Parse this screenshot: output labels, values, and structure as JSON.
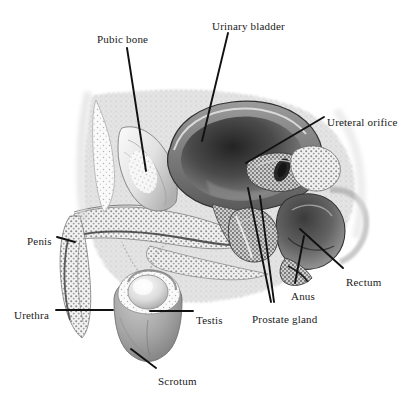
{
  "figure": {
    "background_color": "#ffffff",
    "ink_color": "#1a1a1a",
    "style": "grayscale engraving / stipple halftone",
    "width": 405,
    "height": 400
  },
  "labels": [
    {
      "id": "pubic-bone",
      "text": "Pubic bone",
      "x": 97,
      "y": 33,
      "anchor": "start"
    },
    {
      "id": "urinary-bladder",
      "text": "Urinary bladder",
      "x": 212,
      "y": 20,
      "anchor": "start"
    },
    {
      "id": "ureteral-orifice",
      "text": "Ureteral orifice",
      "x": 327,
      "y": 116,
      "anchor": "start"
    },
    {
      "id": "rectum",
      "text": "Rectum",
      "x": 346,
      "y": 276,
      "anchor": "start"
    },
    {
      "id": "anus",
      "text": "Anus",
      "x": 291,
      "y": 290,
      "anchor": "start"
    },
    {
      "id": "prostate-gland",
      "text": "Prostate gland",
      "x": 252,
      "y": 313,
      "anchor": "start"
    },
    {
      "id": "penis",
      "text": "Penis",
      "x": 27,
      "y": 235,
      "anchor": "start"
    },
    {
      "id": "urethra",
      "text": "Urethra",
      "x": 14,
      "y": 309,
      "anchor": "start"
    },
    {
      "id": "testis",
      "text": "Testis",
      "x": 196,
      "y": 314,
      "anchor": "start"
    },
    {
      "id": "scrotum",
      "text": "Scrotum",
      "x": 158,
      "y": 375,
      "anchor": "start"
    }
  ],
  "leaders": [
    {
      "id": "leader-pubic-bone",
      "points": "127,48 146,171"
    },
    {
      "id": "leader-urinary-bladder",
      "points": "228,33 202,141"
    },
    {
      "id": "leader-ureteral-orifice",
      "points": "324,117 246,163"
    },
    {
      "id": "leader-rectum",
      "points": "343,268 300,229"
    },
    {
      "id": "leader-anus",
      "points": "295,283 304,236"
    },
    {
      "id": "leader-prostate-a",
      "points": "271,302 248,188"
    },
    {
      "id": "leader-prostate-b",
      "points": "274,302 260,196"
    },
    {
      "id": "leader-penis",
      "points": "57,237 75,242"
    },
    {
      "id": "leader-urethra",
      "points": "56,310 113,310"
    },
    {
      "id": "leader-testis",
      "points": "193,311 150,311"
    },
    {
      "id": "leader-scrotum",
      "points": "156,368 131,349"
    }
  ]
}
